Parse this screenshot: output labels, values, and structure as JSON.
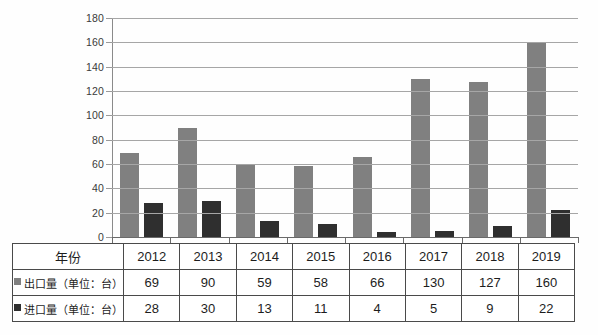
{
  "chart_data": {
    "type": "bar",
    "title": "",
    "subtitle": "",
    "xlabel": "",
    "ylabel": "",
    "categories": [
      "2012",
      "2013",
      "2014",
      "2015",
      "2016",
      "2017",
      "2018",
      "2019"
    ],
    "series": [
      {
        "name": "出口量（单位：台）",
        "short_name": "出口量",
        "color": "#808080",
        "values": [
          69,
          90,
          59,
          58,
          66,
          130,
          127,
          160
        ]
      },
      {
        "name": "进口量（单位：台）",
        "short_name": "进口量",
        "color": "#2f2f2f",
        "values": [
          28,
          30,
          13,
          11,
          4,
          5,
          9,
          22
        ]
      }
    ],
    "ylim": [
      0,
      180
    ],
    "ytick_step": 20,
    "yticks": [
      "0",
      "20",
      "40",
      "60",
      "80",
      "100",
      "120",
      "140",
      "160",
      "180"
    ],
    "grid": true,
    "legend_position": "table-row-labels"
  },
  "table": {
    "row_headers": {
      "year": "年份",
      "export": "出口量（单位：台）",
      "import": "进口量（单位：台）"
    },
    "years": [
      "2012",
      "2013",
      "2014",
      "2015",
      "2016",
      "2017",
      "2018",
      "2019"
    ],
    "export_values": [
      "69",
      "90",
      "59",
      "58",
      "66",
      "130",
      "127",
      "160"
    ],
    "import_values": [
      "28",
      "30",
      "13",
      "11",
      "4",
      "5",
      "9",
      "22"
    ]
  },
  "colors": {
    "export_bar": "#808080",
    "import_bar": "#2f2f2f",
    "gridline": "#a6a6a6",
    "table_border": "#4a4a4a"
  }
}
